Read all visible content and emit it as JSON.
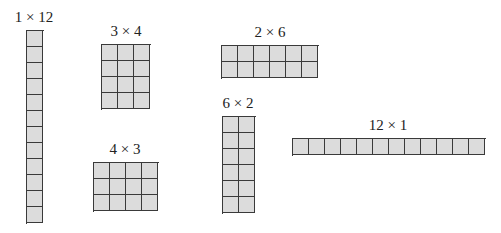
{
  "diagram": {
    "cell_size_px": 16,
    "colors": {
      "cell_fill": "#dcdcdc",
      "cell_border": "#3a3a3a",
      "label_text": "#222222",
      "background": "#ffffff"
    },
    "arrays": [
      {
        "id": "1x12",
        "label": "1 × 12",
        "rows": 12,
        "cols": 1,
        "x": 26,
        "y": 30,
        "label_cx": 34,
        "label_y": 10
      },
      {
        "id": "3x4",
        "label": "3 × 4",
        "rows": 4,
        "cols": 3,
        "x": 101,
        "y": 44,
        "label_cx": 126,
        "label_y": 24
      },
      {
        "id": "4x3",
        "label": "4 × 3",
        "rows": 3,
        "cols": 4,
        "x": 93,
        "y": 162,
        "label_cx": 125,
        "label_y": 142
      },
      {
        "id": "2x6",
        "label": "2 × 6",
        "rows": 2,
        "cols": 6,
        "x": 221,
        "y": 45,
        "label_cx": 270,
        "label_y": 25
      },
      {
        "id": "6x2",
        "label": "6 × 2",
        "rows": 6,
        "cols": 2,
        "x": 222,
        "y": 116,
        "label_cx": 238,
        "label_y": 96
      },
      {
        "id": "12x1",
        "label": "12 × 1",
        "rows": 1,
        "cols": 12,
        "x": 292,
        "y": 138,
        "label_cx": 388,
        "label_y": 118
      }
    ]
  }
}
